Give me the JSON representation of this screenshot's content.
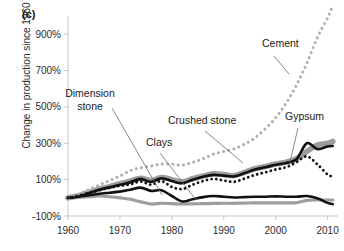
{
  "figure": {
    "panel_label": "(c)",
    "ylabel": "Change in production since 1960"
  },
  "chart_data": {
    "type": "line",
    "title": "",
    "xlabel": "",
    "ylabel": "Change in production since 1960",
    "xlim": [
      1960,
      2012
    ],
    "ylim": [
      -100,
      1000
    ],
    "xticks": [
      1960,
      1970,
      1980,
      1990,
      2000,
      2010
    ],
    "xticklabels": [
      "1960",
      "1970",
      "1980",
      "1990",
      "2000",
      "2010"
    ],
    "yticks": [
      -100,
      100,
      300,
      500,
      700,
      900
    ],
    "yticklabels": [
      "-100%",
      "100%",
      "300%",
      "500%",
      "700%",
      "900%"
    ],
    "grid": false,
    "legend": "annotations",
    "annotations": [
      {
        "label": "Cement",
        "x": 262,
        "y": 47
      },
      {
        "label": "Dimension\nstone",
        "x": 90,
        "y": 97
      },
      {
        "label": "Crushed stone",
        "x": 168,
        "y": 124
      },
      {
        "label": "Clays",
        "x": 146,
        "y": 146
      },
      {
        "label": "Gypsum",
        "x": 285,
        "y": 120
      }
    ],
    "series": [
      {
        "name": "Cement",
        "style": "dotted",
        "color": "#b0b0b0",
        "x": [
          1960,
          1962,
          1964,
          1966,
          1968,
          1970,
          1972,
          1974,
          1976,
          1978,
          1980,
          1982,
          1984,
          1986,
          1988,
          1990,
          1992,
          1994,
          1996,
          1998,
          2000,
          2002,
          2004,
          2006,
          2008,
          2010,
          2011
        ],
        "values": [
          0,
          20,
          45,
          70,
          95,
          120,
          150,
          165,
          175,
          185,
          185,
          180,
          195,
          215,
          240,
          255,
          270,
          295,
          330,
          380,
          440,
          520,
          620,
          740,
          880,
          990,
          1060
        ]
      },
      {
        "name": "Crushed stone",
        "style": "thick-gray",
        "color": "#9d9d9d",
        "x": [
          1960,
          1962,
          1964,
          1966,
          1968,
          1970,
          1972,
          1974,
          1976,
          1978,
          1980,
          1982,
          1984,
          1986,
          1988,
          1990,
          1992,
          1994,
          1996,
          1998,
          2000,
          2002,
          2004,
          2006,
          2008,
          2010,
          2011
        ],
        "values": [
          0,
          12,
          30,
          48,
          62,
          78,
          92,
          108,
          95,
          112,
          100,
          88,
          105,
          120,
          132,
          128,
          122,
          140,
          160,
          172,
          186,
          196,
          215,
          255,
          290,
          300,
          310
        ]
      },
      {
        "name": "Gypsum",
        "style": "dotted-black",
        "color": "#111111",
        "x": [
          1960,
          1962,
          1964,
          1966,
          1968,
          1970,
          1972,
          1974,
          1976,
          1978,
          1980,
          1982,
          1984,
          1986,
          1988,
          1990,
          1992,
          1994,
          1996,
          1998,
          2000,
          2002,
          2004,
          2006,
          2008,
          2010,
          2011
        ],
        "values": [
          0,
          10,
          26,
          42,
          55,
          66,
          74,
          90,
          72,
          92,
          60,
          48,
          72,
          92,
          104,
          95,
          88,
          106,
          126,
          140,
          156,
          168,
          196,
          228,
          185,
          128,
          118
        ]
      },
      {
        "name": "Crushed stone (black overlay)",
        "style": "thick-black",
        "color": "#111111",
        "x": [
          1960,
          1962,
          1964,
          1966,
          1968,
          1970,
          1972,
          1974,
          1976,
          1978,
          1980,
          1982,
          1984,
          1986,
          1988,
          1990,
          1992,
          1994,
          1996,
          1998,
          2000,
          2002,
          2004,
          2006,
          2008,
          2010,
          2011
        ],
        "values": [
          0,
          10,
          26,
          44,
          58,
          72,
          86,
          104,
          88,
          108,
          92,
          80,
          100,
          116,
          126,
          122,
          118,
          136,
          156,
          168,
          182,
          192,
          212,
          300,
          268,
          282,
          285
        ]
      },
      {
        "name": "Dimension stone",
        "style": "thick-black-low",
        "color": "#111111",
        "x": [
          1960,
          1962,
          1964,
          1966,
          1968,
          1970,
          1972,
          1974,
          1976,
          1978,
          1980,
          1982,
          1984,
          1986,
          1988,
          1990,
          1992,
          1994,
          1996,
          1998,
          2000,
          2002,
          2004,
          2006,
          2008,
          2010,
          2011
        ],
        "values": [
          0,
          6,
          14,
          22,
          28,
          34,
          44,
          56,
          38,
          42,
          10,
          -20,
          -8,
          4,
          10,
          6,
          2,
          4,
          6,
          6,
          8,
          6,
          6,
          10,
          -2,
          -28,
          -35
        ]
      },
      {
        "name": "Clays",
        "style": "thick-gray-low",
        "color": "#9d9d9d",
        "x": [
          1960,
          1962,
          1964,
          1966,
          1968,
          1970,
          1972,
          1974,
          1976,
          1978,
          1980,
          1982,
          1984,
          1986,
          1988,
          1990,
          1992,
          1994,
          1996,
          1998,
          2000,
          2002,
          2004,
          2006,
          2008,
          2010,
          2011
        ],
        "values": [
          0,
          2,
          6,
          10,
          6,
          0,
          -8,
          -22,
          -34,
          -30,
          -32,
          -34,
          -33,
          -32,
          -31,
          -30,
          -30,
          -29,
          -28,
          -28,
          -28,
          -28,
          -27,
          -14,
          -12,
          -12,
          -12
        ]
      }
    ]
  }
}
